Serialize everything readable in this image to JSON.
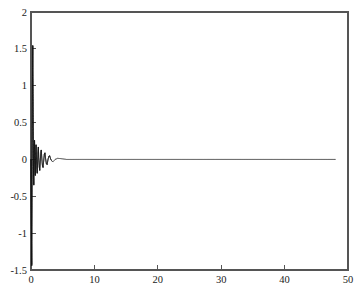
{
  "chart_data": {
    "type": "line",
    "title": "",
    "xlabel": "",
    "ylabel": "",
    "xlim": [
      0,
      50
    ],
    "ylim": [
      -1.5,
      2
    ],
    "grid": false,
    "legend": null,
    "legend_position": "none",
    "background_color": "#ffffff",
    "frame_color": "#555555",
    "line_color": "#111111",
    "text_color": "#1a1a1a",
    "xticks": [
      0,
      10,
      20,
      30,
      40,
      50
    ],
    "xtick_labels": [
      "0",
      "10",
      "20",
      "30",
      "40",
      "50"
    ],
    "yticks": [
      -1.5,
      -1,
      -0.5,
      0,
      0.5,
      1,
      1.5,
      2
    ],
    "ytick_labels": [
      "-1.5",
      "-1",
      "-0.5",
      "0",
      "0.5",
      "1",
      "1.5",
      "2"
    ],
    "tick_direction": "in",
    "series": [
      {
        "name": "signal",
        "color": "#111111",
        "x_start": 0,
        "x_end": 48,
        "peak_value": 1.55,
        "peak_x": 0.28,
        "min_value": -1.45,
        "min_x": 0.12,
        "settle_x": 3.2,
        "tail_value": 0.0,
        "points": [
          [
            0.0,
            0.0
          ],
          [
            0.04,
            -0.62
          ],
          [
            0.08,
            -1.1
          ],
          [
            0.12,
            -1.45
          ],
          [
            0.16,
            -0.5
          ],
          [
            0.2,
            0.65
          ],
          [
            0.24,
            1.2
          ],
          [
            0.28,
            1.55
          ],
          [
            0.32,
            1.02
          ],
          [
            0.36,
            0.3
          ],
          [
            0.4,
            -0.22
          ],
          [
            0.44,
            -0.35
          ],
          [
            0.48,
            -0.12
          ],
          [
            0.52,
            0.2
          ],
          [
            0.56,
            0.26
          ],
          [
            0.6,
            0.08
          ],
          [
            0.64,
            -0.14
          ],
          [
            0.68,
            -0.22
          ],
          [
            0.72,
            -0.08
          ],
          [
            0.76,
            0.12
          ],
          [
            0.8,
            0.2
          ],
          [
            0.86,
            0.04
          ],
          [
            0.92,
            -0.13
          ],
          [
            0.98,
            -0.19
          ],
          [
            1.04,
            -0.05
          ],
          [
            1.1,
            0.11
          ],
          [
            1.16,
            0.17
          ],
          [
            1.22,
            0.03
          ],
          [
            1.3,
            -0.1
          ],
          [
            1.38,
            -0.15
          ],
          [
            1.46,
            -0.03
          ],
          [
            1.54,
            0.09
          ],
          [
            1.62,
            0.13
          ],
          [
            1.7,
            0.02
          ],
          [
            1.8,
            -0.08
          ],
          [
            1.9,
            -0.11
          ],
          [
            2.0,
            -0.02
          ],
          [
            2.1,
            0.07
          ],
          [
            2.2,
            0.09
          ],
          [
            2.3,
            0.01
          ],
          [
            2.42,
            -0.055
          ],
          [
            2.54,
            -0.07
          ],
          [
            2.66,
            -0.01
          ],
          [
            2.8,
            0.04
          ],
          [
            2.94,
            0.05
          ],
          [
            3.1,
            0.005
          ],
          [
            3.3,
            -0.025
          ],
          [
            3.5,
            -0.03
          ],
          [
            3.8,
            0.0
          ],
          [
            4.2,
            0.015
          ],
          [
            4.8,
            0.01
          ],
          [
            5.6,
            0.0
          ],
          [
            7.0,
            0.0
          ],
          [
            12.0,
            0.0
          ],
          [
            20.0,
            0.0
          ],
          [
            30.0,
            0.0
          ],
          [
            40.0,
            0.0
          ],
          [
            48.0,
            0.0
          ]
        ]
      }
    ]
  }
}
